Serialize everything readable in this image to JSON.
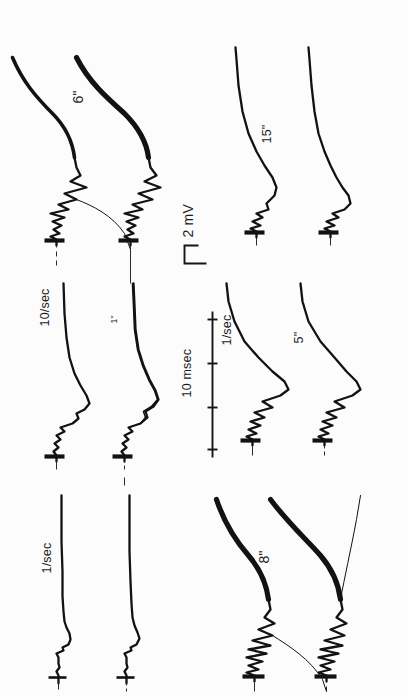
{
  "figure": {
    "kind": "electrophysiology-recording",
    "orientation": "rotated-90-ccw",
    "background_color": "#fcfcfc",
    "trace_color": "#121212",
    "panels": [
      {
        "id": "panel-a",
        "interval_label": "6\"",
        "rate_label": "",
        "position": "top-left",
        "trace_count": 2,
        "description": "Paired superimposed potentials with large negative deflection"
      },
      {
        "id": "panel-b",
        "interval_label": "",
        "rate_label": "10/sec",
        "secondary_label": "1\"",
        "position": "top-middle",
        "trace_count": 2,
        "description": "Paired traces at ten per second"
      },
      {
        "id": "panel-c",
        "interval_label": "",
        "rate_label": "1/sec",
        "position": "top-right",
        "trace_count": 2,
        "description": "Paired traces at one per second"
      },
      {
        "id": "panel-d",
        "interval_label": "15\"",
        "rate_label": "",
        "position": "bottom-left",
        "trace_count": 2,
        "description": "Paired traces, fifteen second interval"
      },
      {
        "id": "panel-e",
        "interval_label": "5\"",
        "rate_label": "1/sec",
        "position": "bottom-middle",
        "trace_count": 2,
        "description": "Paired traces, five second interval"
      },
      {
        "id": "panel-f",
        "interval_label": "8\"",
        "rate_label": "",
        "position": "bottom-right",
        "trace_count": 2,
        "description": "Paired traces with heavy overlapping deflections"
      }
    ],
    "calibration": {
      "voltage": {
        "label": "2 mV",
        "symbol_name": "step-calibration-mark",
        "value": 2,
        "unit": "mV"
      },
      "time": {
        "label": "10 msec",
        "symbol_name": "tick-calibration-bar",
        "value": 10,
        "unit": "msec",
        "tick_count": 4
      }
    }
  }
}
